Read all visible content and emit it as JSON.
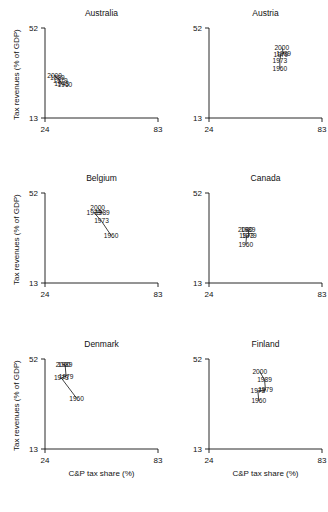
{
  "figure": {
    "axis_labels": {
      "x": "C&P tax share (%)",
      "y": "Tax revenues (% of GDP)"
    },
    "ticks": {
      "x": [
        "24",
        "83"
      ],
      "y": [
        "13",
        "52"
      ]
    }
  },
  "chart_data": {
    "type": "scatter",
    "title": "",
    "xlabel": "C&P tax share (%)",
    "ylabel": "Tax revenues (% of GDP)",
    "xlim": [
      24,
      83
    ],
    "ylim": [
      13,
      52
    ],
    "xticks": [
      24,
      83
    ],
    "yticks": [
      13,
      52
    ],
    "grid": false,
    "legend": false,
    "point_labels": "year",
    "connected": true,
    "panels": [
      {
        "name": "Australia",
        "points": [
          {
            "label": "2000",
            "x": 29.0,
            "y": 31.3
          },
          {
            "label": "1989",
            "x": 30.5,
            "y": 30.4
          },
          {
            "label": "1979",
            "x": 32.0,
            "y": 29.0
          },
          {
            "label": "1973",
            "x": 32.6,
            "y": 27.8
          },
          {
            "label": "1960",
            "x": 34.4,
            "y": 27.5
          }
        ]
      },
      {
        "name": "Austria",
        "points": [
          {
            "label": "2000",
            "x": 62.0,
            "y": 43.5
          },
          {
            "label": "1989",
            "x": 63.0,
            "y": 41.0
          },
          {
            "label": "1979",
            "x": 61.5,
            "y": 40.6
          },
          {
            "label": "1973",
            "x": 61.0,
            "y": 38.0
          },
          {
            "label": "1960",
            "x": 61.0,
            "y": 34.5
          }
        ]
      },
      {
        "name": "Belgium",
        "points": [
          {
            "label": "2000",
            "x": 51.5,
            "y": 45.5
          },
          {
            "label": "1989",
            "x": 54.0,
            "y": 43.5
          },
          {
            "label": "1979",
            "x": 49.5,
            "y": 43.6
          },
          {
            "label": "1973",
            "x": 53.5,
            "y": 39.8
          },
          {
            "label": "1960",
            "x": 58.5,
            "y": 33.6
          }
        ]
      },
      {
        "name": "Canada",
        "points": [
          {
            "label": "2000",
            "x": 43.0,
            "y": 36.0
          },
          {
            "label": "1989",
            "x": 44.4,
            "y": 36.0
          },
          {
            "label": "1979",
            "x": 45.0,
            "y": 33.3
          },
          {
            "label": "1973",
            "x": 43.6,
            "y": 33.3
          },
          {
            "label": "1960",
            "x": 43.2,
            "y": 29.6
          }
        ]
      },
      {
        "name": "Denmark",
        "points": [
          {
            "label": "2000",
            "x": 33.5,
            "y": 49.5
          },
          {
            "label": "1989",
            "x": 34.5,
            "y": 49.5
          },
          {
            "label": "1979",
            "x": 35.0,
            "y": 44.5
          },
          {
            "label": "1973",
            "x": 32.5,
            "y": 43.8
          },
          {
            "label": "1960",
            "x": 40.5,
            "y": 35.0
          }
        ]
      },
      {
        "name": "Finland",
        "points": [
          {
            "label": "2000",
            "x": 50.5,
            "y": 46.5
          },
          {
            "label": "1989",
            "x": 53.0,
            "y": 43.0
          },
          {
            "label": "1979",
            "x": 53.5,
            "y": 38.5
          },
          {
            "label": "1973",
            "x": 49.5,
            "y": 38.2
          },
          {
            "label": "1960",
            "x": 50.0,
            "y": 33.8
          }
        ]
      }
    ]
  }
}
